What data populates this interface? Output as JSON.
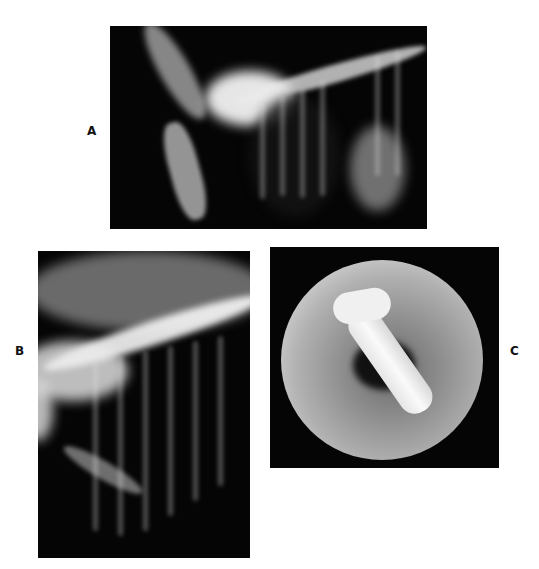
{
  "figure": {
    "panels": [
      {
        "id": "A",
        "label": "A",
        "description": "Lateral thoracic radiograph"
      },
      {
        "id": "B",
        "label": "B",
        "description": "Lateral thoracic radiograph (close-up)"
      },
      {
        "id": "C",
        "label": "C",
        "description": "Endoscopic view of airway with tube/foreign body"
      }
    ],
    "colors": {
      "background": "#ffffff",
      "panel": "#050505",
      "label": "#111111"
    }
  }
}
